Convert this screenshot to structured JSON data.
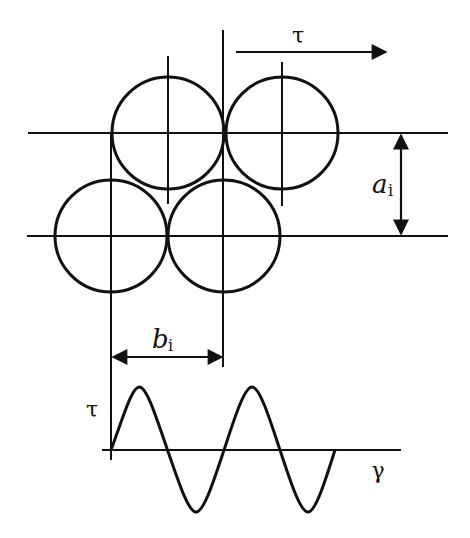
{
  "diagram": {
    "colors": {
      "stroke": "#111111",
      "background": "#ffffff"
    },
    "labels": {
      "shear_top": "τ",
      "interlayer_distance": "a",
      "interlayer_distance_sub": "i",
      "interatomic_spacing": "b",
      "interatomic_spacing_sub": "i",
      "stress_axis": "τ",
      "strain_axis": "γ"
    },
    "atoms": {
      "top_row": [
        {
          "cx": 168,
          "cy": 133,
          "r": 56
        },
        {
          "cx": 282,
          "cy": 133,
          "r": 56
        }
      ],
      "bottom_row": [
        {
          "cx": 111,
          "cy": 236,
          "r": 56
        },
        {
          "cx": 224,
          "cy": 236,
          "r": 56
        }
      ]
    },
    "plane_lines": {
      "top_y": 133,
      "bottom_y": 236,
      "x_start": 27,
      "x_end": 448
    },
    "sine_plot": {
      "origin": {
        "x": 111,
        "y": 450
      },
      "axis_end_x": 401,
      "period_px": 113,
      "amplitude_px": 62,
      "cycles": 2
    }
  }
}
